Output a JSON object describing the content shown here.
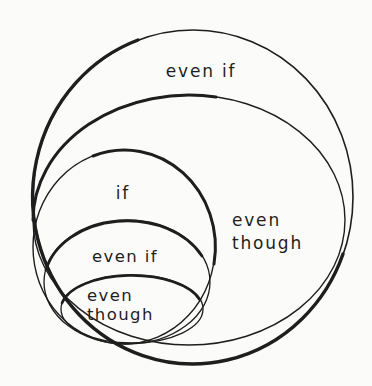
{
  "page": {
    "background": "#fbfbfa"
  },
  "diagram": {
    "type": "euler-nested-circles",
    "ink_color": "#1e1e1e",
    "labels": {
      "outer_even_if": "even if",
      "ring_even": "even",
      "ring_though": "though",
      "if_circle": "if",
      "inner_even_if": "even if",
      "innermost_even": "even",
      "innermost_though": "though"
    },
    "regions_outermost_to_innermost": [
      "even if",
      "even though",
      "if",
      "even if",
      "even though"
    ]
  }
}
